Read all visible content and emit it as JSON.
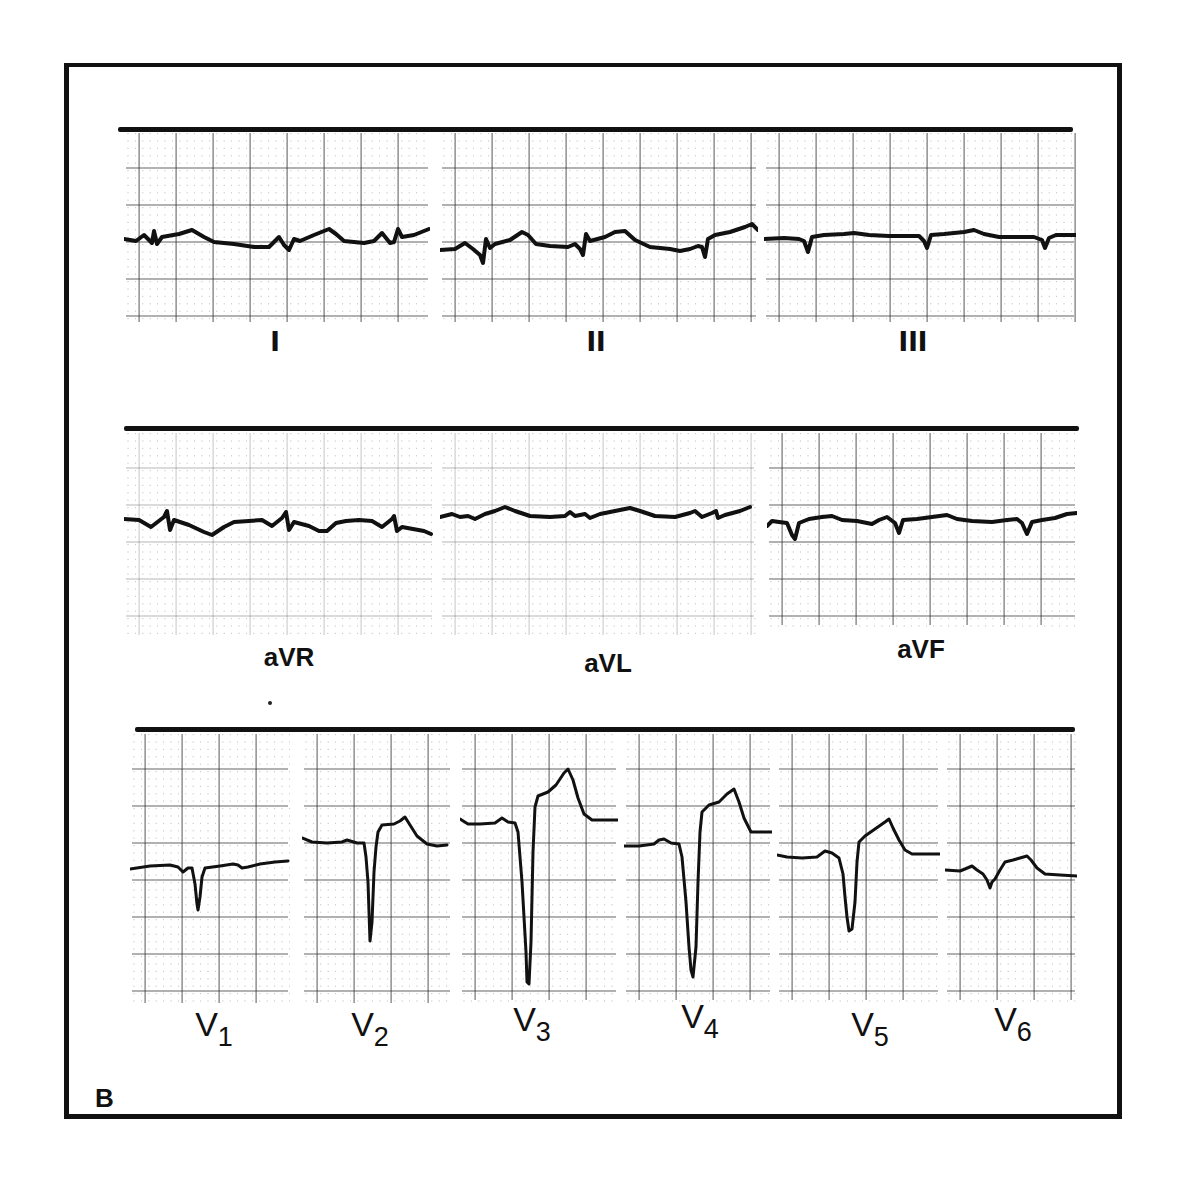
{
  "figure": {
    "panel_letter": "B",
    "colors": {
      "ink": "#111111",
      "grid_major": "#333333",
      "grid_minor": "#777777",
      "background": "#ffffff"
    }
  },
  "rows": [
    {
      "name": "limb-leads",
      "bar": {
        "x": 118,
        "y": 127,
        "w": 955
      },
      "leads": [
        {
          "id": "I",
          "label": "I",
          "label_x": 275,
          "label_y": 340,
          "strip": {
            "x": 124,
            "y": 131,
            "w": 306,
            "h": 195
          },
          "baseline": 240,
          "path": "M0,108 L12,110 L20,104 L28,112 L30,100 L33,113 L38,106 L55,103 L68,99 L80,106 L90,111 L110,113 L130,116 L145,116 L155,106 L160,114 L165,119 L170,108 L176,110 L190,104 L205,98 L212,103 L220,110 L240,112 L250,110 L258,102 L266,112 L270,111 L274,98 L278,106 L290,104 L305,98"
        },
        {
          "id": "II",
          "label": "II",
          "label_x": 596,
          "label_y": 340,
          "strip": {
            "x": 440,
            "y": 131,
            "w": 318,
            "h": 195
          },
          "baseline": 240,
          "path": "M0,119 L15,118 L25,112 L33,118 L40,124 L43,132 L46,108 L50,117 L55,113 L70,109 L82,101 L88,104 L96,113 L110,115 L128,116 L135,113 L140,118 L143,124 L146,103 L150,110 L165,106 L175,101 L185,100 L195,109 L210,116 L230,118 L240,120 L250,118 L258,115 L262,116 L265,126 L268,108 L275,104 L290,101 L305,96 L312,93 L318,99"
        },
        {
          "id": "III",
          "label": "III",
          "label_x": 913,
          "label_y": 340,
          "strip": {
            "x": 764,
            "y": 131,
            "w": 312,
            "h": 195
          },
          "baseline": 240,
          "path": "M0,108 L20,107 L35,108 L40,110 L44,121 L48,106 L60,104 L80,103 L90,102 L105,104 L125,105 L140,105 L155,105 L160,110 L163,117 L167,104 L180,103 L200,101 L210,99 L220,103 L235,106 L250,106 L270,106 L278,109 L281,117 L285,107 L292,104 L312,104"
        }
      ]
    },
    {
      "name": "augmented-leads",
      "bar": {
        "x": 124,
        "y": 426,
        "w": 955
      },
      "leads": [
        {
          "id": "aVR",
          "label": "aVR",
          "label_x": 289,
          "label_y": 658,
          "strip": {
            "x": 124,
            "y": 431,
            "w": 310,
            "h": 208
          },
          "baseline": 530,
          "path": "M0,88 L15,89 L27,96 L40,86 L43,80 L46,99 L50,89 L65,94 L80,101 L88,104 L100,96 L110,91 L125,90 L138,89 L148,95 L158,87 L162,81 L165,99 L170,91 L185,95 L195,100 L203,100 L212,92 L222,90 L235,89 L248,90 L258,96 L268,88 L270,85 L273,100 L278,96 L300,100 L307,103"
        },
        {
          "id": "aVL",
          "label": "aVL",
          "label_x": 608,
          "label_y": 664,
          "strip": {
            "x": 440,
            "y": 431,
            "w": 316,
            "h": 208
          },
          "baseline": 530,
          "path": "M0,86 L12,83 L20,86 L28,85 L35,88 L45,83 L55,80 L65,76 L75,80 L90,85 L110,86 L125,85 L130,81 L135,85 L145,83 L150,87 L160,83 L175,80 L190,77 L200,80 L215,85 L235,86 L250,82 L255,80 L262,86 L272,82 L276,80 L278,87 L285,84 L300,80 L310,76"
        },
        {
          "id": "aVF",
          "label": "aVF",
          "label_x": 921,
          "label_y": 650,
          "strip": {
            "x": 767,
            "y": 431,
            "w": 310,
            "h": 198
          },
          "baseline": 520,
          "path": "M0,95 L5,90 L12,91 L20,92 L25,104 L28,108 L32,92 L42,88 L55,86 L65,85 L75,89 L90,90 L105,93 L112,89 L120,86 L128,92 L132,102 L136,89 L150,88 L165,86 L180,84 L190,88 L205,90 L225,91 L240,89 L250,88 L255,92 L260,103 L265,91 L275,89 L288,87 L300,83 L310,82"
        }
      ]
    },
    {
      "name": "precordial-leads",
      "bar": {
        "x": 135,
        "y": 727,
        "w": 940
      },
      "leads": [
        {
          "id": "V1",
          "sub": "1",
          "base": "V",
          "label_x": 214,
          "label_y": 1030,
          "strip": {
            "x": 130,
            "y": 732,
            "w": 160,
            "h": 275
          },
          "baseline": 860,
          "path": "M0,137 L20,134 L40,133 L48,135 L53,140 L58,136 L62,136 L65,152 L67,172 L68,178 L70,165 L72,145 L75,136 L90,134 L103,132 L108,133 L112,136 L118,135 L130,132 L145,130 L158,129"
        },
        {
          "id": "V2",
          "sub": "2",
          "base": "V",
          "label_x": 370,
          "label_y": 1030,
          "strip": {
            "x": 302,
            "y": 732,
            "w": 150,
            "h": 275
          },
          "baseline": 860,
          "path": "M0,106 L10,110 L25,111 L40,110 L45,108 L55,111 L62,111 L64,125 L66,150 L67,180 L68,209 L70,190 L72,140 L74,115 L76,100 L80,93 L92,92 L98,89 L103,85 L108,93 L115,104 L125,112 L135,114 L145,113"
        },
        {
          "id": "V3",
          "sub": "3",
          "base": "V",
          "label_x": 532,
          "label_y": 1025,
          "strip": {
            "x": 460,
            "y": 732,
            "w": 158,
            "h": 272
          },
          "baseline": 856,
          "path": "M0,87 L8,92 L20,92 L35,91 L42,86 L48,90 L55,91 L58,100 L62,150 L66,220 L67,250 L69,252 L71,210 L73,120 L75,75 L78,64 L88,60 L96,53 L104,41 L108,37 L113,48 L118,66 L124,82 L132,88 L145,88 L158,88"
        },
        {
          "id": "V4",
          "sub": "4",
          "base": "V",
          "label_x": 700,
          "label_y": 1022,
          "strip": {
            "x": 624,
            "y": 732,
            "w": 148,
            "h": 272
          },
          "baseline": 856,
          "path": "M0,114 L15,114 L30,112 L35,108 L40,107 L47,111 L55,112 L58,125 L62,170 L65,215 L67,238 L69,245 L72,215 L74,150 L76,100 L78,80 L85,73 L95,70 L103,62 L110,57 L115,70 L120,86 L127,100 L140,100 L148,100"
        },
        {
          "id": "V5",
          "sub": "5",
          "base": "V",
          "label_x": 870,
          "label_y": 1030,
          "strip": {
            "x": 777,
            "y": 732,
            "w": 163,
            "h": 272
          },
          "baseline": 856,
          "path": "M0,123 L10,125 L25,126 L40,125 L48,119 L55,121 L62,126 L66,142 L68,165 L70,185 L72,199 L75,197 L78,170 L80,130 L82,110 L88,104 L98,97 L108,90 L112,87 L116,96 L122,108 L128,118 L135,122 L150,122 L163,122"
        },
        {
          "id": "V6",
          "sub": "6",
          "base": "V",
          "label_x": 1013,
          "label_y": 1025,
          "strip": {
            "x": 945,
            "y": 732,
            "w": 132,
            "h": 272
          },
          "baseline": 856,
          "path": "M0,138 L15,139 L20,137 L27,134 L32,138 L38,142 L42,148 L45,156 L47,150 L50,147 L55,138 L60,130 L68,128 L75,126 L82,124 L86,128 L92,136 L100,142 L115,143 L132,144"
        }
      ]
    }
  ]
}
